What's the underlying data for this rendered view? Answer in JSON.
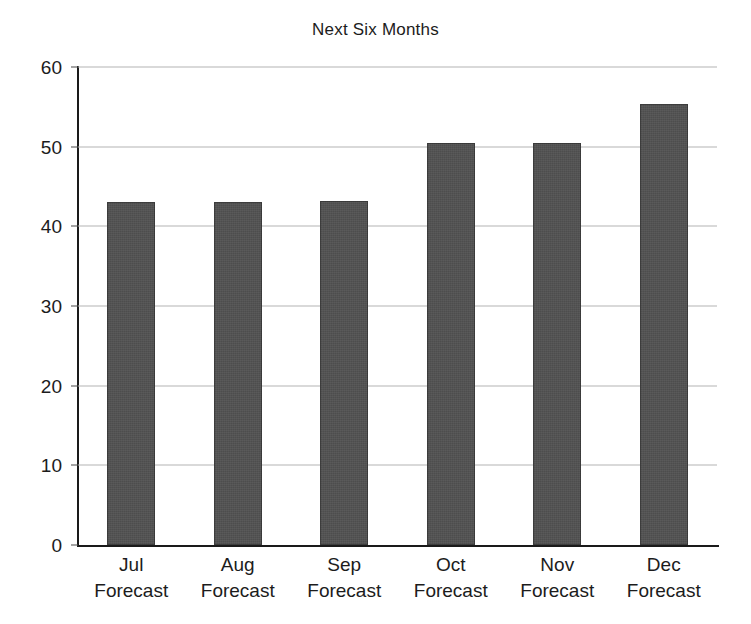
{
  "chart_data": {
    "type": "bar",
    "title": "Next Six Months",
    "xlabel": "",
    "ylabel": "",
    "categories": [
      "Jul\nForecast",
      "Aug\nForecast",
      "Sep\nForecast",
      "Oct\nForecast",
      "Nov\nForecast",
      "Dec\nForecast"
    ],
    "category_lines": [
      {
        "line1": "Jul",
        "line2": "Forecast"
      },
      {
        "line1": "Aug",
        "line2": "Forecast"
      },
      {
        "line1": "Sep",
        "line2": "Forecast"
      },
      {
        "line1": "Oct",
        "line2": "Forecast"
      },
      {
        "line1": "Nov",
        "line2": "Forecast"
      },
      {
        "line1": "Dec",
        "line2": "Forecast"
      }
    ],
    "values": [
      43.1,
      43.1,
      43.2,
      50.4,
      50.4,
      55.3
    ],
    "ylim": [
      0,
      60
    ],
    "yticks": [
      0,
      10,
      20,
      30,
      40,
      50,
      60
    ],
    "ytick_labels": [
      "0",
      "10",
      "20",
      "30",
      "40",
      "50",
      "60"
    ],
    "grid": true,
    "grid_axis": "y",
    "legend": false,
    "bar_color": "#4d4d4d",
    "grid_color": "#b4b4b4",
    "axis_color": "#1a1a1a",
    "background_color": "#ffffff"
  }
}
